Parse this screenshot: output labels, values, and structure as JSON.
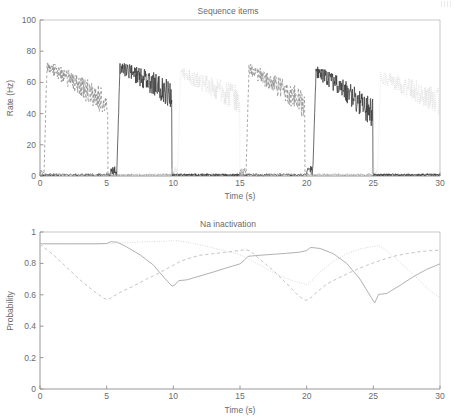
{
  "figure": {
    "title_top": "Sequence items",
    "title_bottom": "Na inactivation",
    "corner_mark": "page-edge-artifact"
  },
  "panels": [
    {
      "id": "rate",
      "title": "Sequence items",
      "xlabel": "Time (s)",
      "ylabel": "Rate (Hz)",
      "xticks": [
        "0",
        "5",
        "10",
        "15",
        "20",
        "25",
        "30"
      ],
      "yticks": [
        "0",
        "20",
        "40",
        "60",
        "80",
        "100"
      ]
    },
    {
      "id": "na-inactivation",
      "title": "Na inactivation",
      "xlabel": "Time (s)",
      "ylabel": "Probability",
      "xticks": [
        "0",
        "5",
        "10",
        "15",
        "20",
        "25",
        "30"
      ],
      "yticks": [
        "0",
        "0.2",
        "0.4",
        "0.6",
        "0.8",
        "1"
      ]
    }
  ],
  "chart_data": [
    {
      "type": "line",
      "id": "sequence-items",
      "title": "Sequence items",
      "xlabel": "Time (s)",
      "ylabel": "Rate (Hz)",
      "xlim": [
        0,
        30
      ],
      "ylim": [
        0,
        100
      ],
      "xticks": [
        0,
        5,
        10,
        15,
        20,
        25,
        30
      ],
      "yticks": [
        0,
        20,
        40,
        60,
        80,
        100
      ],
      "grid": false,
      "legend": "none",
      "noise_amplitude_active": 6.5,
      "noise_amplitude_baseline": 1.2,
      "series": [
        {
          "name": "item 1",
          "style": "dashed",
          "color": "#8a8a8a",
          "width": 0.75,
          "bursts": [
            {
              "t_on": 0.3,
              "t_off": 5.1,
              "peak": 71,
              "end": 45,
              "onset": 0.22
            },
            {
              "t_on": 15.45,
              "t_off": 19.85,
              "peak": 69,
              "end": 45,
              "onset": 0.22
            }
          ],
          "baseline": 0.8
        },
        {
          "name": "item 2",
          "style": "solid",
          "color": "#3a3a3a",
          "width": 0.75,
          "bursts": [
            {
              "t_on": 5.75,
              "t_off": 9.9,
              "peak": 70,
              "end": 52,
              "onset": 0.25
            },
            {
              "t_on": 20.45,
              "t_off": 24.95,
              "peak": 68,
              "end": 40,
              "onset": 0.25
            }
          ],
          "baseline": 0.8
        },
        {
          "name": "item 3",
          "style": "dotted",
          "color": "#d8d8d8",
          "width": 0.75,
          "bursts": [
            {
              "t_on": 10.3,
              "t_off": 15.0,
              "peak": 66,
              "end": 48,
              "onset": 0.25
            },
            {
              "t_on": 25.3,
              "t_off": 29.95,
              "peak": 64,
              "end": 47,
              "onset": 0.25
            }
          ],
          "baseline": 0.8
        }
      ]
    },
    {
      "type": "line",
      "id": "na-inactivation",
      "title": "Na inactivation",
      "xlabel": "Time (s)",
      "ylabel": "Probability",
      "xlim": [
        0,
        30
      ],
      "ylim": [
        0,
        1
      ],
      "xticks": [
        0,
        5,
        10,
        15,
        20,
        25,
        30
      ],
      "yticks": [
        0,
        0.2,
        0.4,
        0.6,
        0.8,
        1
      ],
      "grid": false,
      "legend": "none",
      "series": [
        {
          "name": "item 2 (solid)",
          "style": "solid",
          "color": "#a8a8a8",
          "width": 0.9,
          "x": [
            0,
            1,
            2,
            3,
            4,
            5,
            5.3,
            5.8,
            6.5,
            7.5,
            8.5,
            9.3,
            9.9,
            10.1,
            10.4,
            11,
            12,
            13,
            14,
            15,
            15.3,
            15.6,
            16.5,
            17.5,
            18.5,
            19.5,
            20,
            20.3,
            21,
            22,
            23,
            24,
            24.9,
            25.1,
            25.4,
            26,
            27,
            28,
            29,
            30
          ],
          "y": [
            0.925,
            0.925,
            0.925,
            0.925,
            0.925,
            0.927,
            0.938,
            0.935,
            0.905,
            0.855,
            0.79,
            0.71,
            0.655,
            0.662,
            0.69,
            0.695,
            0.72,
            0.745,
            0.772,
            0.797,
            0.818,
            0.845,
            0.852,
            0.858,
            0.864,
            0.872,
            0.882,
            0.902,
            0.895,
            0.862,
            0.8,
            0.7,
            0.575,
            0.548,
            0.603,
            0.608,
            0.66,
            0.715,
            0.762,
            0.797
          ]
        },
        {
          "name": "item 1 (dashed)",
          "style": "dashed",
          "color": "#bdbdbd",
          "width": 0.9,
          "x": [
            0,
            1,
            2,
            3,
            4,
            4.8,
            5.1,
            5.4,
            6,
            7,
            8,
            9,
            10,
            10.5,
            11,
            12,
            13,
            14,
            15,
            15.4,
            15.8,
            16.5,
            17.5,
            18.5,
            19.4,
            19.9,
            20.2,
            20.6,
            21.5,
            22.5,
            23.5,
            24.5,
            25.5,
            26.5,
            27.5,
            28.5,
            29.2,
            30
          ],
          "y": [
            0.922,
            0.855,
            0.775,
            0.695,
            0.625,
            0.578,
            0.568,
            0.585,
            0.615,
            0.655,
            0.7,
            0.742,
            0.788,
            0.812,
            0.828,
            0.852,
            0.862,
            0.872,
            0.882,
            0.888,
            0.878,
            0.825,
            0.755,
            0.672,
            0.592,
            0.565,
            0.572,
            0.605,
            0.668,
            0.712,
            0.752,
            0.788,
            0.818,
            0.845,
            0.862,
            0.875,
            0.881,
            0.884
          ]
        },
        {
          "name": "item 3 (dotted)",
          "style": "dotted",
          "color": "#cfcfcf",
          "width": 0.9,
          "x": [
            0,
            2,
            4,
            5,
            5.5,
            6.5,
            7.5,
            8.5,
            9.5,
            10.2,
            10.5,
            11,
            12,
            13,
            14,
            15,
            15.5,
            16,
            17,
            17.5,
            18,
            19,
            20,
            20.5,
            21,
            22,
            23,
            24,
            25,
            25.4,
            25.8,
            26.5,
            27.5,
            28.5,
            29.3,
            30
          ],
          "y": [
            0.922,
            0.922,
            0.922,
            0.923,
            0.928,
            0.932,
            0.936,
            0.939,
            0.942,
            0.945,
            0.942,
            0.935,
            0.918,
            0.898,
            0.878,
            0.855,
            0.838,
            0.812,
            0.765,
            0.742,
            0.722,
            0.688,
            0.665,
            0.698,
            0.745,
            0.812,
            0.862,
            0.892,
            0.908,
            0.912,
            0.895,
            0.845,
            0.768,
            0.688,
            0.622,
            0.582
          ]
        }
      ]
    }
  ]
}
